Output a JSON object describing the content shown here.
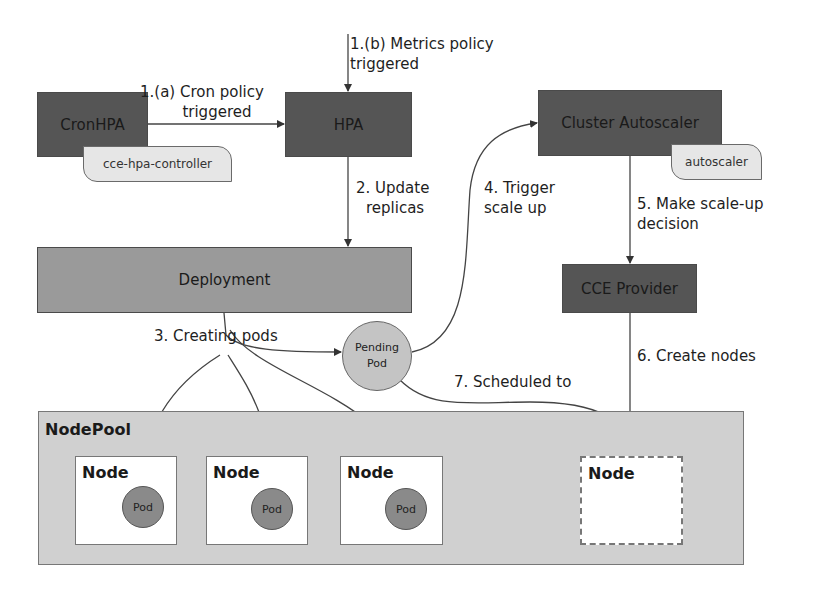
{
  "components": {
    "cronhpa": "CronHPA",
    "cronhpa_tag": "cce-hpa-controller",
    "hpa": "HPA",
    "cluster_autoscaler": "Cluster Autoscaler",
    "autoscaler_tag": "autoscaler",
    "cce_provider": "CCE Provider",
    "deployment": "Deployment",
    "pending_pod": [
      "Pending",
      "Pod"
    ],
    "nodepool": "NodePool"
  },
  "nodes": [
    {
      "label": "Node",
      "pod": "Pod"
    },
    {
      "label": "Node",
      "pod": "Pod"
    },
    {
      "label": "Node",
      "pod": "Pod"
    },
    {
      "label": "Node",
      "pod": null,
      "new": true
    }
  ],
  "steps": {
    "step1a": [
      "1.(a) Cron policy",
      "triggered"
    ],
    "step1b": [
      "1.(b) Metrics policy",
      "triggered"
    ],
    "step2": [
      "2. Update",
      "replicas"
    ],
    "step3": "3. Creating pods",
    "step4": [
      "4. Trigger",
      "scale up"
    ],
    "step5": [
      "5. Make scale-up",
      "decision"
    ],
    "step6": "6. Create nodes",
    "step7": "7. Scheduled to"
  },
  "colors": {
    "dark_box": "#555555",
    "deployment_box": "#9a9a9a",
    "nodepool_bg": "#d0d0d0",
    "pod_fill": "#8a8a8a",
    "pending_pod_fill": "#c4c4c4",
    "tag_fill": "#e6e6e6"
  }
}
